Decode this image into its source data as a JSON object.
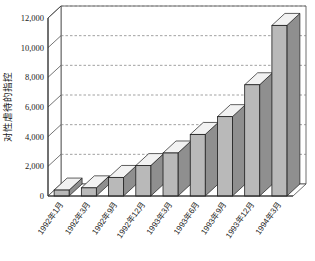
{
  "chart_data": {
    "type": "bar",
    "title": "",
    "subtitle": "",
    "xlabel": "",
    "ylabel": "对性虐待的指控",
    "ylim": [
      0,
      12000
    ],
    "ytick_labels": [
      "12,000",
      "10,000",
      "8,000",
      "6,000",
      "4,000",
      "2,000",
      "0"
    ],
    "ytick_values": [
      12000,
      10000,
      8000,
      6000,
      4000,
      2000,
      0
    ],
    "grid": true,
    "grid_style": "dashed-horizontal",
    "legend": "none",
    "three_d": true,
    "categories": [
      "1992年1月",
      "1992年3月",
      "1992年9月",
      "1992年12月",
      "1993年3月",
      "1993年6月",
      "1993年9月",
      "1993年12月",
      "1994年3月"
    ],
    "values": [
      400,
      550,
      1250,
      2050,
      2900,
      4150,
      5350,
      7500,
      11500
    ],
    "series": [
      {
        "name": "对性虐待的指控",
        "values": [
          400,
          550,
          1250,
          2050,
          2900,
          4150,
          5350,
          7500,
          11500
        ]
      }
    ]
  },
  "style": {
    "bar_face_color": "#b9b9b9",
    "bar_side_color": "#8f8f8f",
    "bar_top_color": "#f2f2f2",
    "bar_outline_color": "#1c1c1c",
    "grid_color": "#7a7a7a",
    "axis_color": "#3a3a3a",
    "plot_background": "#ffffff",
    "page_background": "#ffffff",
    "text_color": "#1a1a1a"
  }
}
